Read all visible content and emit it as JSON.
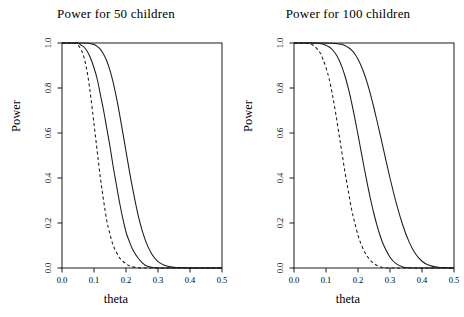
{
  "figure": {
    "background": "#ffffff",
    "ink_color": "#1a1a1a",
    "ylabel": "Power",
    "xlabel": "theta"
  },
  "chart_data": [
    {
      "type": "line",
      "title": "Power for 50 children",
      "xlabel": "theta",
      "ylabel": "Power",
      "xlim": [
        0.0,
        0.5
      ],
      "ylim": [
        0.0,
        1.0
      ],
      "xticks": [
        0.0,
        0.1,
        0.2,
        0.3,
        0.4,
        0.5
      ],
      "xtick_labels": [
        "0.0",
        "0.1",
        "0.2",
        "0.3",
        "0.4",
        "0.5"
      ],
      "yticks": [
        0.0,
        0.2,
        0.4,
        0.6,
        0.8,
        1.0
      ],
      "ytick_labels": [
        "0.0",
        "0.2",
        "0.4",
        "0.6",
        "0.8",
        "1.0"
      ],
      "grid": false,
      "legend": "none",
      "x": [
        0.0,
        0.02,
        0.04,
        0.05,
        0.06,
        0.07,
        0.08,
        0.09,
        0.1,
        0.11,
        0.12,
        0.13,
        0.14,
        0.15,
        0.16,
        0.17,
        0.18,
        0.19,
        0.2,
        0.21,
        0.22,
        0.24,
        0.26,
        0.28,
        0.3,
        0.32,
        0.34,
        0.36,
        0.4,
        0.45,
        0.5
      ],
      "series": [
        {
          "name": "dashed-curve",
          "style": "dashed",
          "values": [
            1.0,
            1.0,
            1.0,
            0.99,
            0.97,
            0.93,
            0.86,
            0.76,
            0.64,
            0.52,
            0.4,
            0.3,
            0.21,
            0.15,
            0.1,
            0.07,
            0.045,
            0.03,
            0.018,
            0.01,
            0.005,
            0.001,
            0.0,
            0.0,
            0.0,
            0.0,
            0.0,
            0.0,
            0.0,
            0.0,
            0.0
          ]
        },
        {
          "name": "solid-curve-middle",
          "style": "solid",
          "values": [
            1.0,
            1.0,
            1.0,
            1.0,
            0.99,
            0.98,
            0.96,
            0.93,
            0.89,
            0.84,
            0.77,
            0.7,
            0.62,
            0.54,
            0.45,
            0.37,
            0.29,
            0.22,
            0.16,
            0.12,
            0.085,
            0.04,
            0.012,
            0.003,
            0.0,
            0.0,
            0.0,
            0.0,
            0.0,
            0.0,
            0.0
          ]
        },
        {
          "name": "solid-curve-right",
          "style": "solid",
          "values": [
            1.0,
            1.0,
            1.0,
            1.0,
            1.0,
            1.0,
            0.999,
            0.997,
            0.993,
            0.985,
            0.972,
            0.95,
            0.92,
            0.878,
            0.824,
            0.758,
            0.683,
            0.602,
            0.518,
            0.436,
            0.358,
            0.222,
            0.125,
            0.063,
            0.028,
            0.012,
            0.005,
            0.002,
            0.0,
            0.0,
            0.0
          ]
        }
      ]
    },
    {
      "type": "line",
      "title": "Power for 100 children",
      "xlabel": "theta",
      "ylabel": "Power",
      "xlim": [
        0.0,
        0.5
      ],
      "ylim": [
        0.0,
        1.0
      ],
      "xticks": [
        0.0,
        0.1,
        0.2,
        0.3,
        0.4,
        0.5
      ],
      "xtick_labels": [
        "0.0",
        "0.1",
        "0.2",
        "0.3",
        "0.4",
        "0.5"
      ],
      "yticks": [
        0.0,
        0.2,
        0.4,
        0.6,
        0.8,
        1.0
      ],
      "ytick_labels": [
        "0.0",
        "0.2",
        "0.4",
        "0.6",
        "0.8",
        "1.0"
      ],
      "grid": false,
      "legend": "none",
      "x": [
        0.0,
        0.02,
        0.04,
        0.06,
        0.08,
        0.09,
        0.1,
        0.11,
        0.12,
        0.13,
        0.14,
        0.15,
        0.16,
        0.17,
        0.18,
        0.19,
        0.2,
        0.21,
        0.22,
        0.23,
        0.24,
        0.25,
        0.26,
        0.27,
        0.28,
        0.3,
        0.32,
        0.34,
        0.36,
        0.38,
        0.4,
        0.42,
        0.45,
        0.5
      ],
      "series": [
        {
          "name": "dashed-curve",
          "style": "dashed",
          "values": [
            1.0,
            1.0,
            1.0,
            0.99,
            0.96,
            0.93,
            0.89,
            0.84,
            0.77,
            0.69,
            0.6,
            0.51,
            0.42,
            0.34,
            0.26,
            0.2,
            0.145,
            0.105,
            0.073,
            0.05,
            0.032,
            0.02,
            0.011,
            0.005,
            0.002,
            0.0,
            0.0,
            0.0,
            0.0,
            0.0,
            0.0,
            0.0,
            0.0,
            0.0
          ]
        },
        {
          "name": "solid-curve-middle",
          "style": "solid",
          "values": [
            1.0,
            1.0,
            1.0,
            1.0,
            0.998,
            0.995,
            0.99,
            0.982,
            0.97,
            0.952,
            0.927,
            0.893,
            0.85,
            0.797,
            0.735,
            0.666,
            0.592,
            0.516,
            0.44,
            0.368,
            0.3,
            0.24,
            0.186,
            0.14,
            0.102,
            0.048,
            0.018,
            0.005,
            0.001,
            0.0,
            0.0,
            0.0,
            0.0,
            0.0
          ]
        },
        {
          "name": "solid-curve-right",
          "style": "solid",
          "values": [
            1.0,
            1.0,
            1.0,
            1.0,
            1.0,
            1.0,
            1.0,
            0.999,
            0.999,
            0.998,
            0.996,
            0.993,
            0.988,
            0.98,
            0.968,
            0.951,
            0.928,
            0.898,
            0.861,
            0.817,
            0.766,
            0.71,
            0.65,
            0.588,
            0.525,
            0.4,
            0.286,
            0.19,
            0.115,
            0.062,
            0.03,
            0.013,
            0.003,
            0.0
          ]
        }
      ]
    }
  ],
  "panels": [
    {
      "id": "left",
      "title": "Power for 50 children",
      "ylabel": "Power",
      "xlabel": "theta",
      "xtick_labels": [
        "0.0",
        "0.1",
        "0.2",
        "0.3",
        "0.4",
        "0.5"
      ],
      "ytick_labels": [
        "0.0",
        "0.2",
        "0.4",
        "0.6",
        "0.8",
        "1.0"
      ]
    },
    {
      "id": "right",
      "title": "Power for 100 children",
      "ylabel": "Power",
      "xlabel": "theta",
      "xtick_labels": [
        "0.0",
        "0.1",
        "0.2",
        "0.3",
        "0.4",
        "0.5"
      ],
      "ytick_labels": [
        "0.0",
        "0.2",
        "0.4",
        "0.6",
        "0.8",
        "1.0"
      ]
    }
  ]
}
